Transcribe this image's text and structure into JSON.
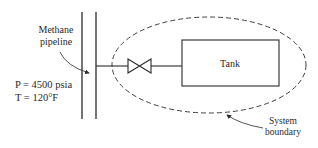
{
  "diagram": {
    "pipeline_label": [
      "Methane",
      "pipeline"
    ],
    "pressure_label": "P = 4500 psia",
    "temperature_label": "T = 120°F",
    "tank_label": "Tank",
    "boundary_label": [
      "System",
      "boundary"
    ],
    "colors": {
      "line": "#2a2a2a",
      "background": "#ffffff"
    }
  }
}
